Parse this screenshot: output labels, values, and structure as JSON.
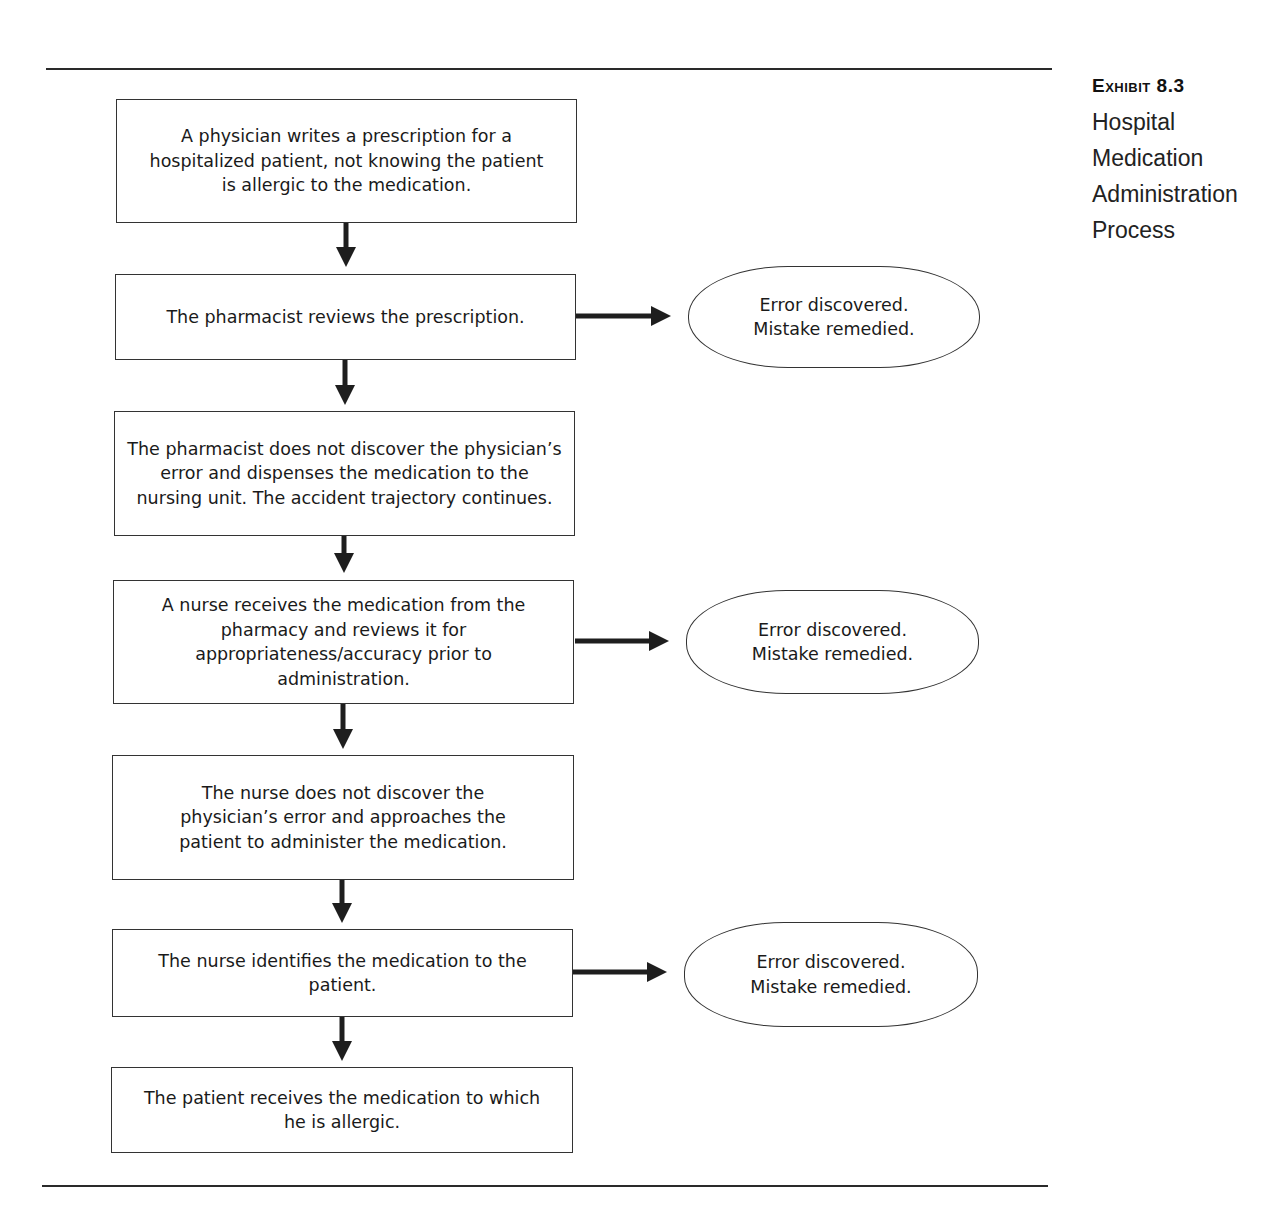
{
  "caption": {
    "exhibit_prefix": "Exhibit",
    "exhibit_number": "8.3",
    "title_lines": [
      "Hospital",
      "Medication",
      "Administration",
      "Process"
    ]
  },
  "flow": {
    "steps": [
      {
        "text": "A physician writes a prescription for a hospitalized patient, not knowing the patient is allergic to the medication."
      },
      {
        "text": "The pharmacist reviews the prescription."
      },
      {
        "text": "The pharmacist does not discover the physician’s error and dispenses the medication to the nursing unit. The accident trajectory continues."
      },
      {
        "text": "A nurse receives the medication from the pharmacy and reviews it for appropriateness/accuracy prior to administration."
      },
      {
        "text": "The nurse does not discover the physician’s error and approaches the patient to administer the medication."
      },
      {
        "text": "The nurse identifies the medication to the patient."
      },
      {
        "text": "The patient receives the medication to which he is allergic."
      }
    ],
    "outcomes": [
      {
        "from_step": 2,
        "line1": "Error discovered.",
        "line2": "Mistake remedied."
      },
      {
        "from_step": 4,
        "line1": "Error discovered.",
        "line2": "Mistake remedied."
      },
      {
        "from_step": 6,
        "line1": "Error discovered.",
        "line2": "Mistake remedied."
      }
    ]
  },
  "colors": {
    "line": "#2a2a2a",
    "box_border": "#333333",
    "text": "#1a1a1a"
  }
}
